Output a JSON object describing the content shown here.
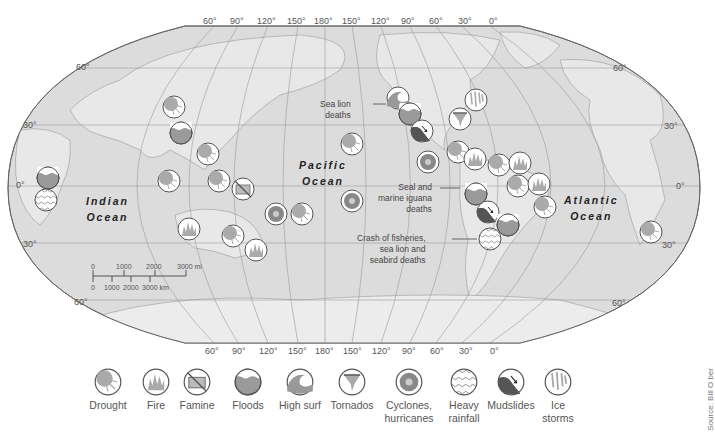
{
  "map": {
    "type": "world climate impact map",
    "background_color": "#d9d9d9",
    "land_color": "#e6e6e6",
    "coast_color": "#8a8a8a",
    "grid_color": "#9a9a9a",
    "top_longitude_labels": [
      "60°",
      "90°",
      "120°",
      "150°",
      "180°",
      "150°",
      "120°",
      "90°",
      "60°",
      "30°",
      "0°"
    ],
    "bottom_longitude_labels": [
      "60°",
      "90°",
      "120°",
      "150°",
      "180°",
      "150°",
      "120°",
      "90°",
      "60°",
      "30°",
      "0°"
    ],
    "left_latitude_labels": [
      "60°",
      "30°",
      "0°",
      "30°",
      "60°"
    ],
    "right_latitude_labels": [
      "60°",
      "30°",
      "0°",
      "30°",
      "60°"
    ],
    "oceans": [
      {
        "name": "Indian\nOcean"
      },
      {
        "name": "Pacific\nOcean"
      },
      {
        "name": "Atlantic\nOcean"
      }
    ],
    "annotations": [
      {
        "text": "Sea lion\ndeaths"
      },
      {
        "text": "Seal and\nmarine iguana\ndeaths"
      },
      {
        "text": "Crash of fisheries,\nsea lion and\nseabird deaths"
      }
    ],
    "scale_bar": {
      "miles_ticks": [
        "0",
        "1000",
        "2000",
        "3000 mi"
      ],
      "km_ticks": [
        "0",
        "1000",
        "2000",
        "3000 km"
      ]
    },
    "markers": [
      {
        "type": "floods",
        "x": 48,
        "y": 178
      },
      {
        "type": "heavy_rainfall",
        "x": 46,
        "y": 200
      },
      {
        "type": "drought",
        "x": 174,
        "y": 107
      },
      {
        "type": "floods",
        "x": 181,
        "y": 133
      },
      {
        "type": "drought",
        "x": 208,
        "y": 154
      },
      {
        "type": "drought",
        "x": 169,
        "y": 181
      },
      {
        "type": "drought",
        "x": 219,
        "y": 181
      },
      {
        "type": "famine",
        "x": 243,
        "y": 189
      },
      {
        "type": "cyclones",
        "x": 276,
        "y": 214
      },
      {
        "type": "drought",
        "x": 302,
        "y": 214
      },
      {
        "type": "fire",
        "x": 189,
        "y": 229
      },
      {
        "type": "drought",
        "x": 233,
        "y": 236
      },
      {
        "type": "fire",
        "x": 256,
        "y": 250
      },
      {
        "type": "drought",
        "x": 352,
        "y": 144
      },
      {
        "type": "cyclones",
        "x": 352,
        "y": 201
      },
      {
        "type": "high_surf",
        "x": 398,
        "y": 98
      },
      {
        "type": "floods",
        "x": 410,
        "y": 114
      },
      {
        "type": "mudslides",
        "x": 422,
        "y": 131
      },
      {
        "type": "cyclones",
        "x": 428,
        "y": 162
      },
      {
        "type": "ice_storms",
        "x": 476,
        "y": 100
      },
      {
        "type": "tornados",
        "x": 460,
        "y": 119
      },
      {
        "type": "drought",
        "x": 458,
        "y": 152
      },
      {
        "type": "fire",
        "x": 475,
        "y": 159
      },
      {
        "type": "drought",
        "x": 499,
        "y": 165
      },
      {
        "type": "fire",
        "x": 520,
        "y": 163
      },
      {
        "type": "drought",
        "x": 518,
        "y": 186
      },
      {
        "type": "fire",
        "x": 539,
        "y": 184
      },
      {
        "type": "drought",
        "x": 545,
        "y": 207
      },
      {
        "type": "floods",
        "x": 476,
        "y": 194
      },
      {
        "type": "mudslides",
        "x": 488,
        "y": 212
      },
      {
        "type": "floods",
        "x": 508,
        "y": 225
      },
      {
        "type": "heavy_rainfall",
        "x": 490,
        "y": 239
      },
      {
        "type": "drought",
        "x": 651,
        "y": 232
      }
    ]
  },
  "legend": {
    "items": [
      {
        "type": "drought",
        "label": "Drought"
      },
      {
        "type": "fire",
        "label": "Fire"
      },
      {
        "type": "famine",
        "label": "Famine"
      },
      {
        "type": "floods",
        "label": "Floods"
      },
      {
        "type": "high_surf",
        "label": "High surf"
      },
      {
        "type": "tornados",
        "label": "Tornados"
      },
      {
        "type": "cyclones",
        "label": "Cyclones,\nhurricanes"
      },
      {
        "type": "heavy_rainfall",
        "label": "Heavy\nrainfall"
      },
      {
        "type": "mudslides",
        "label": "Mudslides"
      },
      {
        "type": "ice_storms",
        "label": "Ice\nstorms"
      }
    ]
  },
  "source": "Source: Bill O ber"
}
